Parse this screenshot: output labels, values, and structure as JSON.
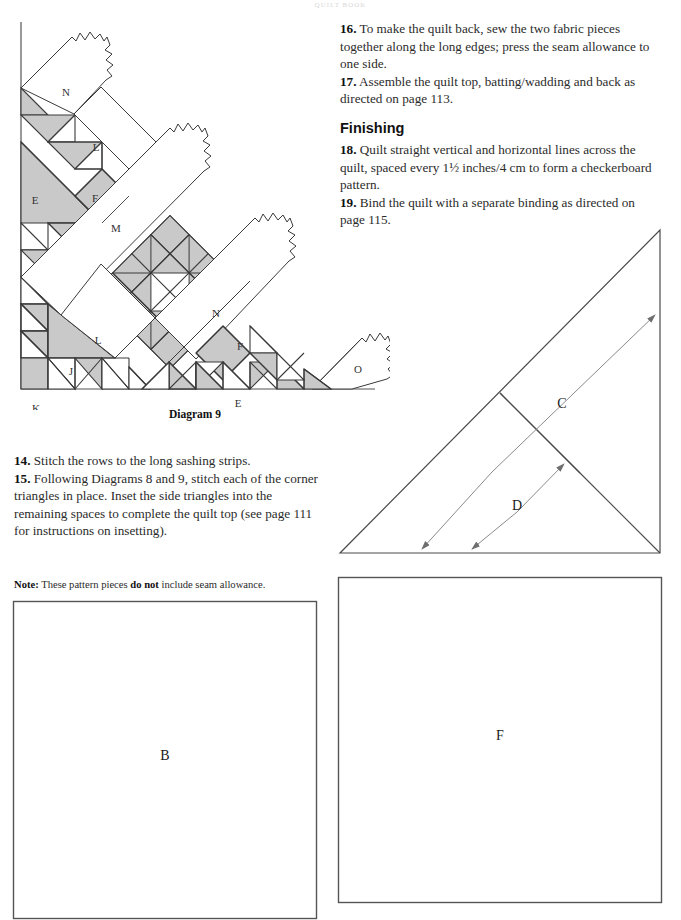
{
  "page": {
    "running_head": "QUILT BOOK",
    "width": 681,
    "height": 920
  },
  "colors": {
    "fabric_gray": "#c9c9c9",
    "line": "#3a3a3a",
    "line_light": "#6e6e6e",
    "text": "#2b2b2b",
    "paper": "#ffffff"
  },
  "instructions_upper": [
    {
      "number": "16.",
      "text": " To make the quilt back, sew the two fabric pieces together along the long edges; press the seam allowance to one side."
    },
    {
      "number": "17.",
      "text": " Assemble the quilt top, batting/wadding and back as directed on page 113."
    }
  ],
  "finishing": {
    "heading": "Finishing",
    "items": [
      {
        "number": "18.",
        "text": " Quilt straight vertical and horizontal lines across the quilt, spaced every 1½ inches/4 cm to form a checkerboard pattern."
      },
      {
        "number": "19.",
        "text": " Bind the quilt with a separate binding as directed on page 115."
      }
    ]
  },
  "instructions_lower": [
    {
      "number": "14.",
      "text": " Stitch the rows to the long sashing strips."
    },
    {
      "number": "15.",
      "text": " Following Diagrams 8 and 9, stitch each of the corner triangles in place. Inset the side triangles into the remaining spaces to complete the quilt top (see page 111 for instructions on insetting)."
    }
  ],
  "note": {
    "label": "Note:",
    "text_before": " These pattern pieces ",
    "emphasis": "do not",
    "text_after": " include seam allowance."
  },
  "diagram9": {
    "caption": "Diagram 9",
    "piece_labels": [
      {
        "id": "N",
        "label": "N",
        "x": 66,
        "y": 76
      },
      {
        "id": "L1",
        "label": "L",
        "x": 96,
        "y": 131
      },
      {
        "id": "E1",
        "label": "E",
        "x": 35,
        "y": 184
      },
      {
        "id": "F1",
        "label": "F",
        "x": 95,
        "y": 182
      },
      {
        "id": "M",
        "label": "M",
        "x": 116,
        "y": 212
      },
      {
        "id": "N2",
        "label": "N",
        "x": 216,
        "y": 297
      },
      {
        "id": "L2",
        "label": "L",
        "x": 98,
        "y": 324
      },
      {
        "id": "F2",
        "label": "F",
        "x": 240,
        "y": 330
      },
      {
        "id": "O",
        "label": "O",
        "x": 358,
        "y": 353
      },
      {
        "id": "J",
        "label": "J",
        "x": 71,
        "y": 355
      },
      {
        "id": "E2",
        "label": "E",
        "x": 238,
        "y": 387
      },
      {
        "id": "K",
        "label": "K",
        "x": 36,
        "y": 392
      }
    ]
  },
  "triangle_diagram": {
    "labels": [
      {
        "id": "C",
        "label": "C"
      },
      {
        "id": "D",
        "label": "D"
      }
    ]
  },
  "pattern_pieces": [
    {
      "id": "B",
      "label": "B",
      "shape": "square"
    },
    {
      "id": "F",
      "label": "F",
      "shape": "square"
    }
  ]
}
